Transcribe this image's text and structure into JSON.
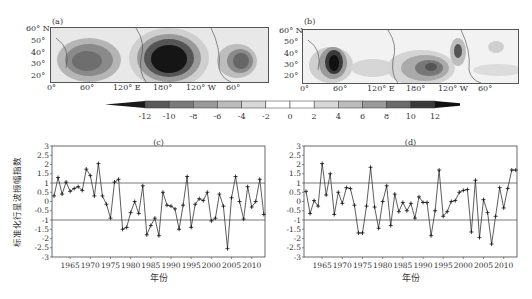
{
  "maps": [
    {
      "tag": "(a)",
      "lat_labels": [
        "60° N",
        "50°",
        "40°",
        "30°",
        "20°"
      ],
      "lon_labels": [
        "0°",
        "60°",
        "120° E",
        "180°",
        "120° W",
        "60°"
      ]
    },
    {
      "tag": "(b)",
      "lat_labels": [
        "60° N",
        "50°",
        "40°",
        "30°",
        "20°"
      ],
      "lon_labels": [
        "0°",
        "60°",
        "120° E",
        "180°",
        "120° W",
        "60°"
      ]
    }
  ],
  "colorbar": {
    "labels": [
      "-12",
      "-10",
      "-8",
      "-6",
      "-4",
      "-2",
      "0",
      "2",
      "4",
      "6",
      "8",
      "10",
      "12"
    ],
    "colors": [
      "#1a1a1a",
      "#5a5a5a",
      "#7a7a7a",
      "#9a9a9a",
      "#bbbbbb",
      "#d8d8d8",
      "#ffffff",
      "#ffffff",
      "#d8d8d8",
      "#bbbbbb",
      "#9a9a9a",
      "#6a6a6a",
      "#3a3a3a",
      "#111111"
    ]
  },
  "chart_data": [
    {
      "type": "line",
      "panel": "(c)",
      "title": "",
      "xlabel": "年份",
      "ylabel": "标准化行星波振幅指数",
      "ylim": [
        -3,
        3
      ],
      "yticks": [
        "3",
        "2.5",
        "2",
        "1.5",
        "1",
        "0.5",
        "0",
        "-0.5",
        "-1",
        "-1.5",
        "-2",
        "-2.5",
        "-3"
      ],
      "xticks": [
        "1965",
        "1970",
        "1975",
        "1980",
        "1985",
        "1990",
        "1995",
        "2000",
        "2005",
        "2010"
      ],
      "reference_lines": [
        1,
        -1
      ],
      "x": [
        1961,
        1962,
        1963,
        1964,
        1965,
        1966,
        1967,
        1968,
        1969,
        1970,
        1971,
        1972,
        1973,
        1974,
        1975,
        1976,
        1977,
        1978,
        1979,
        1980,
        1981,
        1982,
        1983,
        1984,
        1985,
        1986,
        1987,
        1988,
        1989,
        1990,
        1991,
        1992,
        1993,
        1994,
        1995,
        1996,
        1997,
        1998,
        1999,
        2000,
        2001,
        2002,
        2003,
        2004,
        2005,
        2006,
        2007,
        2008,
        2009,
        2010,
        2011,
        2012,
        2013
      ],
      "series": [
        {
          "name": "index",
          "values": [
            0.3,
            1.3,
            0.4,
            1.05,
            0.55,
            0.7,
            0.8,
            0.6,
            1.75,
            1.4,
            0.3,
            2.05,
            0.3,
            -0.15,
            -0.9,
            1.05,
            1.2,
            -1.5,
            -1.4,
            -0.6,
            0.0,
            -0.65,
            0.85,
            -1.8,
            -1.3,
            -0.9,
            -1.85,
            0.5,
            -0.2,
            -0.25,
            -0.4,
            -1.5,
            -0.2,
            1.35,
            -1.4,
            -0.15,
            0.15,
            0.05,
            0.5,
            -1.05,
            -0.9,
            0.4,
            -0.25,
            -2.55,
            0.2,
            1.35,
            0.0,
            -0.95,
            0.8,
            -0.3,
            0.0,
            1.2,
            -0.7
          ]
        }
      ]
    },
    {
      "type": "line",
      "panel": "(d)",
      "title": "",
      "xlabel": "年份",
      "ylabel": "",
      "ylim": [
        -3,
        3
      ],
      "yticks": [
        "3",
        "2.5",
        "2",
        "1.5",
        "1",
        "0.5",
        "0",
        "-0.5",
        "-1",
        "-1.5",
        "-2",
        "-2.5",
        "-3"
      ],
      "xticks": [
        "1965",
        "1970",
        "1975",
        "1980",
        "1985",
        "1990",
        "1995",
        "2000",
        "2005",
        "2010"
      ],
      "reference_lines": [
        1,
        -1
      ],
      "x": [
        1961,
        1962,
        1963,
        1964,
        1965,
        1966,
        1967,
        1968,
        1969,
        1970,
        1971,
        1972,
        1973,
        1974,
        1975,
        1976,
        1977,
        1978,
        1979,
        1980,
        1981,
        1982,
        1983,
        1984,
        1985,
        1986,
        1987,
        1988,
        1989,
        1990,
        1991,
        1992,
        1993,
        1994,
        1995,
        1996,
        1997,
        1998,
        1999,
        2000,
        2001,
        2002,
        2003,
        2004,
        2005,
        2006,
        2007,
        2008,
        2009,
        2010,
        2011,
        2012,
        2013
      ],
      "series": [
        {
          "name": "index",
          "values": [
            0.55,
            -0.65,
            0.05,
            -0.25,
            2.05,
            0.35,
            1.5,
            -0.7,
            0.5,
            -0.1,
            0.75,
            0.7,
            -0.2,
            -1.7,
            -1.7,
            -0.25,
            1.85,
            -0.3,
            -1.45,
            0.0,
            0.85,
            -1.3,
            0.4,
            -0.55,
            -0.05,
            -0.5,
            -0.1,
            -0.9,
            0.25,
            -0.05,
            -0.05,
            -1.85,
            -0.5,
            1.7,
            -0.8,
            -0.55,
            0.0,
            0.05,
            0.5,
            0.6,
            0.65,
            -1.65,
            1.15,
            -1.95,
            0.1,
            -0.6,
            -2.3,
            -0.8,
            0.75,
            -0.35,
            0.7,
            1.7,
            1.7
          ]
        }
      ]
    }
  ]
}
